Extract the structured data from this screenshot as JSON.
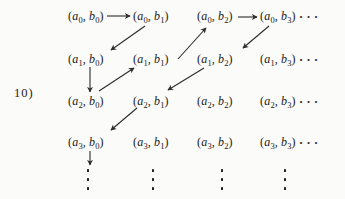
{
  "figure_label": "10)",
  "colors": {
    "ink": "#212121",
    "paper": "#fbfbf9",
    "arrow": "#2b2b2b"
  },
  "grid": {
    "open": "(",
    "comma": ",",
    "close": ")",
    "rows": [
      {
        "cells": [
          {
            "a": "a",
            "a_sub": "0",
            "b": "b",
            "b_sub": "0"
          },
          {
            "a": "a",
            "a_sub": "0",
            "b": "b",
            "b_sub": "1"
          },
          {
            "a": "a",
            "a_sub": "0",
            "b": "b",
            "b_sub": "2"
          },
          {
            "a": "a",
            "a_sub": "0",
            "b": "b",
            "b_sub": "3"
          }
        ],
        "trailing_ellipsis": "···"
      },
      {
        "cells": [
          {
            "a": "a",
            "a_sub": "1",
            "b": "b",
            "b_sub": "0"
          },
          {
            "a": "a",
            "a_sub": "1",
            "b": "b",
            "b_sub": "1"
          },
          {
            "a": "a",
            "a_sub": "1",
            "b": "b",
            "b_sub": "2"
          },
          {
            "a": "a",
            "a_sub": "1",
            "b": "b",
            "b_sub": "3"
          }
        ],
        "trailing_ellipsis": "···"
      },
      {
        "cells": [
          {
            "a": "a",
            "a_sub": "2",
            "b": "b",
            "b_sub": "0"
          },
          {
            "a": "a",
            "a_sub": "2",
            "b": "b",
            "b_sub": "1"
          },
          {
            "a": "a",
            "a_sub": "2",
            "b": "b",
            "b_sub": "2"
          },
          {
            "a": "a",
            "a_sub": "2",
            "b": "b",
            "b_sub": "3"
          }
        ],
        "trailing_ellipsis": "···"
      },
      {
        "cells": [
          {
            "a": "a",
            "a_sub": "3",
            "b": "b",
            "b_sub": "0"
          },
          {
            "a": "a",
            "a_sub": "3",
            "b": "b",
            "b_sub": "1"
          },
          {
            "a": "a",
            "a_sub": "3",
            "b": "b",
            "b_sub": "2"
          },
          {
            "a": "a",
            "a_sub": "3",
            "b": "b",
            "b_sub": "3"
          }
        ],
        "trailing_ellipsis": "···"
      }
    ]
  },
  "arrows": [
    {
      "from": "(a0,b0)",
      "to": "(a0,b1)",
      "direction": "right"
    },
    {
      "from": "(a0,b1)",
      "to": "(a1,b0)",
      "direction": "down-left"
    },
    {
      "from": "(a1,b0)",
      "to": "(a2,b0)",
      "direction": "down"
    },
    {
      "from": "(a2,b0)",
      "to": "(a1,b1)",
      "direction": "up-right"
    },
    {
      "from": "(a1,b1)",
      "to": "(a0,b2)",
      "direction": "up-right"
    },
    {
      "from": "(a0,b2)",
      "to": "(a0,b3)",
      "direction": "right"
    },
    {
      "from": "(a0,b3)",
      "to": "(a1,b2)",
      "direction": "down-left"
    },
    {
      "from": "(a1,b2)",
      "to": "(a2,b1)",
      "direction": "down-left"
    },
    {
      "from": "(a2,b1)",
      "to": "(a3,b0)",
      "direction": "down-left"
    },
    {
      "from": "(a3,b0)",
      "to": "continuation-below",
      "direction": "down"
    }
  ],
  "column_dots": {
    "dot_count": 3,
    "columns": 4
  }
}
